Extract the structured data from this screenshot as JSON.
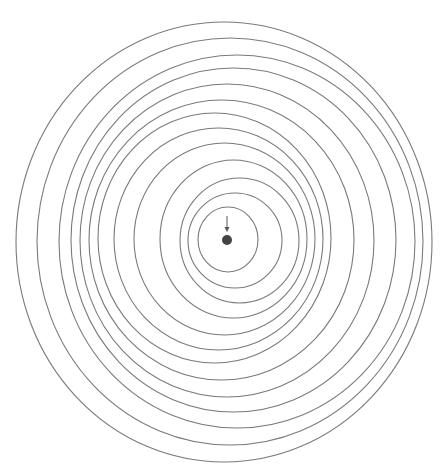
{
  "diagram": {
    "width": 445,
    "height": 474,
    "background": "#ffffff",
    "stroke_color": "#7a7a7a",
    "stroke_width": 1.1,
    "rings": [
      {
        "left": 16,
        "right": 432,
        "top": 22,
        "bottom": 462
      },
      {
        "left": 37,
        "right": 423,
        "top": 38,
        "bottom": 445
      },
      {
        "left": 59,
        "right": 415,
        "top": 55,
        "bottom": 428
      },
      {
        "left": 71,
        "right": 396,
        "top": 68,
        "bottom": 412
      },
      {
        "left": 80,
        "right": 374,
        "top": 84,
        "bottom": 397
      },
      {
        "left": 89,
        "right": 354,
        "top": 100,
        "bottom": 380
      },
      {
        "left": 98,
        "right": 331,
        "top": 113,
        "bottom": 363
      },
      {
        "left": 114,
        "right": 323,
        "top": 128,
        "bottom": 350
      },
      {
        "left": 134,
        "right": 315,
        "top": 143,
        "bottom": 335
      },
      {
        "left": 160,
        "right": 307,
        "top": 160,
        "bottom": 318
      },
      {
        "left": 180,
        "right": 299,
        "top": 178,
        "bottom": 303
      },
      {
        "left": 188,
        "right": 282,
        "top": 193,
        "bottom": 288
      },
      {
        "left": 198,
        "right": 258,
        "top": 207,
        "bottom": 272
      }
    ],
    "center_dot": {
      "cx": 227,
      "cy": 240,
      "r": 5,
      "color": "#444444"
    },
    "arrow": {
      "x": 227,
      "y1": 216,
      "y2": 232,
      "color": "#555555"
    }
  }
}
